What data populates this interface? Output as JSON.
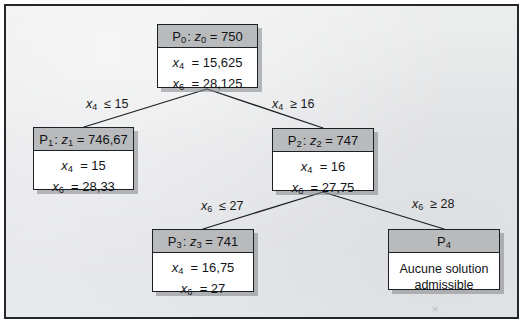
{
  "diagram": {
    "type": "branch-and-bound-tree",
    "title_visible": false,
    "colors": {
      "frame_border": "#23262b",
      "page_background": "#e7e8ea",
      "node_header_fill": "#b9babc",
      "node_body_fill": "#ffffff",
      "node_border": "#1c1f23",
      "edge_stroke": "#1c1f23",
      "text": "#121417"
    },
    "artifact_mark": "×",
    "nodes": [
      {
        "id": "P0",
        "header": "P₀ : z₀ = 750",
        "header_parts": {
          "label": "P",
          "label_sub": "0",
          "var": "z",
          "var_sub": "0",
          "value": "750"
        },
        "rows": [
          {
            "var": "x",
            "sub": "4",
            "op": "=",
            "value": "15,625"
          },
          {
            "var": "x",
            "sub": "6",
            "op": "=",
            "value": "28,125"
          }
        ]
      },
      {
        "id": "P1",
        "header": "P₁ : z₁ = 746,67",
        "header_parts": {
          "label": "P",
          "label_sub": "1",
          "var": "z",
          "var_sub": "1",
          "value": "746,67"
        },
        "rows": [
          {
            "var": "x",
            "sub": "4",
            "op": "=",
            "value": "15"
          },
          {
            "var": "x",
            "sub": "6",
            "op": "=",
            "value": "28,33"
          }
        ]
      },
      {
        "id": "P2",
        "header": "P₂ : z₂ = 747",
        "header_parts": {
          "label": "P",
          "label_sub": "2",
          "var": "z",
          "var_sub": "2",
          "value": "747"
        },
        "rows": [
          {
            "var": "x",
            "sub": "4",
            "op": "=",
            "value": "16"
          },
          {
            "var": "x",
            "sub": "6",
            "op": "=",
            "value": "27,75"
          }
        ]
      },
      {
        "id": "P3",
        "header": "P₃ : z₃ = 741",
        "header_parts": {
          "label": "P",
          "label_sub": "3",
          "var": "z",
          "var_sub": "3",
          "value": "741"
        },
        "rows": [
          {
            "var": "x",
            "sub": "4",
            "op": "=",
            "value": "16,75"
          },
          {
            "var": "x",
            "sub": "6",
            "op": "=",
            "value": "27"
          }
        ]
      },
      {
        "id": "P4",
        "header": "P₄",
        "header_parts": {
          "label": "P",
          "label_sub": "4",
          "var": "",
          "var_sub": "",
          "value": ""
        },
        "text_lines": [
          "Aucune solution",
          "admissible"
        ]
      }
    ],
    "edges": [
      {
        "from": "P0",
        "to": "P1",
        "label": "x₄ ≤ 15",
        "var": "x",
        "sub": "4",
        "op": "≤",
        "value": "15"
      },
      {
        "from": "P0",
        "to": "P2",
        "label": "x₄ ≥ 16",
        "var": "x",
        "sub": "4",
        "op": "≥",
        "value": "16"
      },
      {
        "from": "P2",
        "to": "P3",
        "label": "x₆ ≤ 27",
        "var": "x",
        "sub": "6",
        "op": "≤",
        "value": "27"
      },
      {
        "from": "P2",
        "to": "P4",
        "label": "x₆ ≥ 28",
        "var": "x",
        "sub": "6",
        "op": "≥",
        "value": "28"
      }
    ]
  }
}
